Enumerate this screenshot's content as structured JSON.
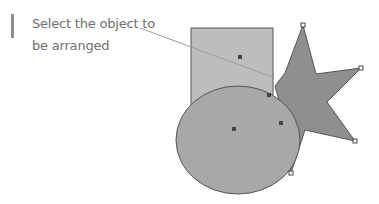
{
  "caption": {
    "line1": "Select the object to",
    "line2": "be arranged"
  },
  "colors": {
    "rectangle_fill": "#bdbdbd",
    "ellipse_fill": "#a8a8a8",
    "star_fill": "#8f8f8f",
    "outline": "#555555",
    "handle": "#444444",
    "callout_line": "#9a9a9a",
    "caption_text": "#6f6f6f",
    "accent_bar": "#8c8c8c"
  },
  "shapes": [
    "rectangle",
    "star",
    "ellipse"
  ]
}
